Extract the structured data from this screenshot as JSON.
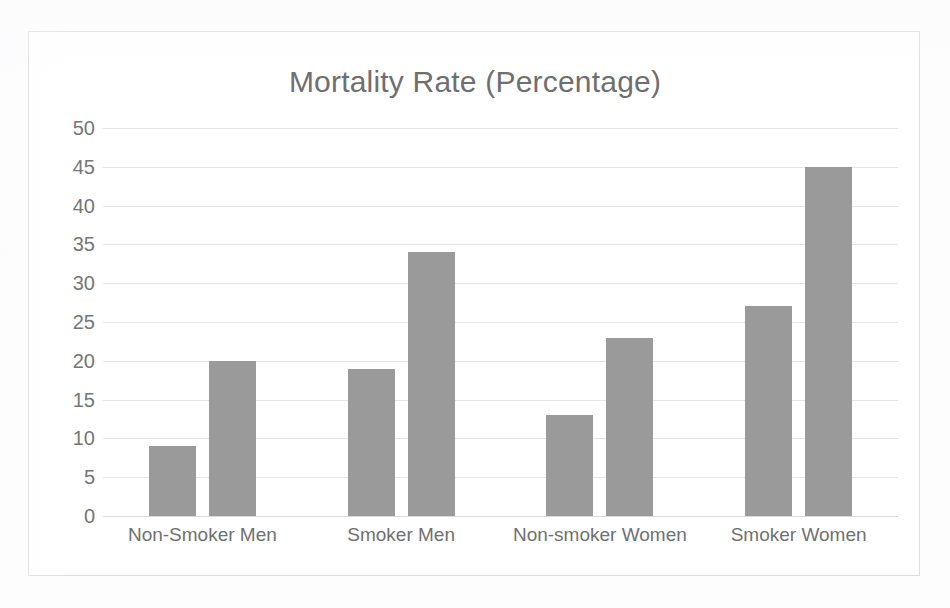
{
  "chart_data": {
    "type": "bar",
    "title": "Mortality Rate (Percentage)",
    "xlabel": "",
    "ylabel": "",
    "categories": [
      "Non-Smoker Men",
      "Smoker Men",
      "Non-smoker Women",
      "Smoker Women"
    ],
    "series": [
      {
        "name": "Series 1",
        "values": [
          9,
          19,
          13,
          27
        ]
      },
      {
        "name": "Series 2",
        "values": [
          20,
          34,
          23,
          45
        ]
      }
    ],
    "ylim": [
      0,
      50
    ],
    "ytick_labels": [
      "50",
      "45",
      "40",
      "35",
      "30",
      "25",
      "20",
      "15",
      "10",
      "5",
      "0"
    ],
    "ytick_values": [
      50,
      45,
      40,
      35,
      30,
      25,
      20,
      15,
      10,
      5,
      0
    ],
    "ytick_step": 5,
    "grid": true,
    "legend": "none",
    "bar_color": "#9a9a9a",
    "gridline_color": "#e4e4e4",
    "title_color": "#6f6f6f",
    "tick_label_color": "#767676",
    "border_color": "#dcdcdc",
    "background_color": "#ffffff"
  }
}
